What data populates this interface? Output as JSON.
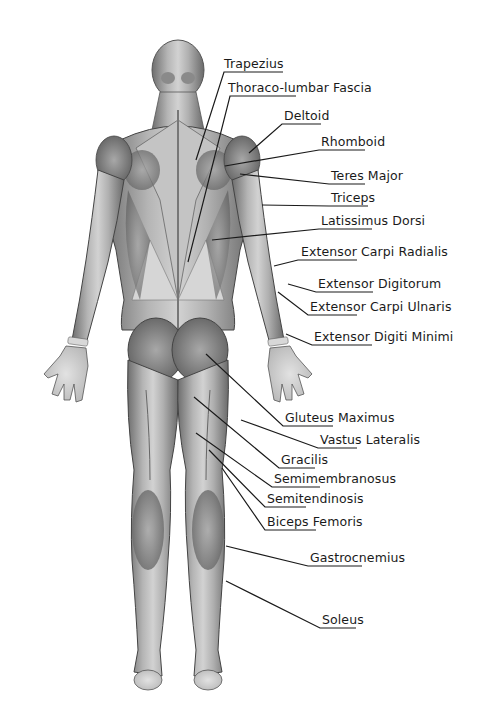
{
  "diagram": {
    "view": "posterior",
    "labels": [
      {
        "text": "Trapezius",
        "x": 224,
        "y": 57,
        "target": [
          196,
          160
        ],
        "underline": [
          224,
          283
        ]
      },
      {
        "text": "Thoraco-lumbar Fascia",
        "x": 228,
        "y": 81,
        "target": [
          188,
          262
        ],
        "underline": [
          230,
          296
        ]
      },
      {
        "text": "Deltoid",
        "x": 284,
        "y": 109,
        "target": [
          249,
          153
        ],
        "underline": [
          282,
          321
        ]
      },
      {
        "text": "Rhomboid",
        "x": 321,
        "y": 135,
        "target": [
          225,
          166
        ],
        "underline": [
          319,
          365
        ]
      },
      {
        "text": "Teres Major",
        "x": 331,
        "y": 169,
        "target": [
          240,
          174
        ],
        "underline": [
          329,
          365
        ]
      },
      {
        "text": "Triceps",
        "x": 331,
        "y": 191,
        "target": [
          262,
          205
        ],
        "underline": [
          329,
          368
        ]
      },
      {
        "text": "Latissimus Dorsi",
        "x": 321,
        "y": 214,
        "target": [
          212,
          240
        ],
        "underline": [
          319,
          372
        ]
      },
      {
        "text": "Extensor Carpi Radialis",
        "x": 301,
        "y": 245,
        "target": [
          274,
          266
        ],
        "underline": [
          298,
          357
        ]
      },
      {
        "text": "Extensor Digitorum",
        "x": 318,
        "y": 277,
        "target": [
          288,
          284
        ],
        "underline": [
          316,
          373
        ]
      },
      {
        "text": "Extensor Carpi Ulnaris",
        "x": 310,
        "y": 300,
        "target": [
          278,
          292
        ],
        "underline": [
          308,
          357
        ]
      },
      {
        "text": "Extensor Digiti Minimi",
        "x": 314,
        "y": 330,
        "target": [
          286,
          334
        ],
        "underline": [
          312,
          372
        ]
      },
      {
        "text": "Gluteus Maximus",
        "x": 285,
        "y": 411,
        "target": [
          206,
          354
        ],
        "underline": [
          283,
          333
        ]
      },
      {
        "text": "Vastus Lateralis",
        "x": 320,
        "y": 433,
        "target": [
          241,
          420
        ],
        "underline": [
          318,
          357
        ]
      },
      {
        "text": "Gracilis",
        "x": 281,
        "y": 453,
        "target": [
          194,
          397
        ],
        "underline": [
          279,
          315
        ]
      },
      {
        "text": "Semimembranosus",
        "x": 274,
        "y": 472,
        "target": [
          196,
          433
        ],
        "underline": [
          272,
          320
        ]
      },
      {
        "text": "Semitendinosis",
        "x": 267,
        "y": 492,
        "target": [
          209,
          450
        ],
        "underline": [
          265,
          306
        ]
      },
      {
        "text": "Biceps Femoris",
        "x": 267,
        "y": 515,
        "target": [
          222,
          468
        ],
        "underline": [
          265,
          316
        ]
      },
      {
        "text": "Gastrocnemius",
        "x": 310,
        "y": 551,
        "target": [
          226,
          546
        ],
        "underline": [
          308,
          362
        ]
      },
      {
        "text": "Soleus",
        "x": 322,
        "y": 613,
        "target": [
          226,
          581
        ],
        "underline": [
          320,
          356
        ]
      }
    ]
  }
}
